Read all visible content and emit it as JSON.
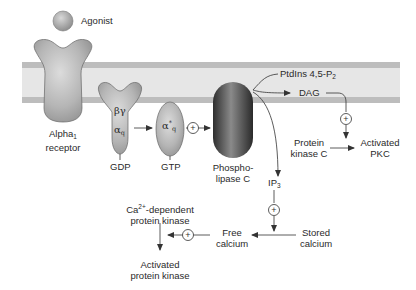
{
  "diagram": {
    "colors": {
      "membrane_band": "#bdbdbd",
      "membrane_core": "#e6e6e6",
      "protein_fill": "#b8b8b8",
      "plc_fill": "#555555",
      "line": "#333333",
      "text": "#2a2a2a"
    },
    "labels": {
      "agonist": "Agonist",
      "alpha1_receptor_line1": "Alpha",
      "alpha1_receptor_sub": "1",
      "alpha1_receptor_line2": "receptor",
      "beta_gamma": "βγ",
      "alpha_q": "α",
      "alpha_q_sub": "q",
      "alpha_star": "α",
      "alpha_star_sup": "*",
      "alpha_star_sub": "q",
      "gdp": "GDP",
      "gtp": "GTP",
      "plc_line1": "Phospho-",
      "plc_line2": "lipase C",
      "pip2_main": "PtdIns 4,5-P",
      "pip2_sub": "2",
      "dag": "DAG",
      "pkc_line1": "Protein",
      "pkc_line2": "kinase C",
      "activated_pkc_line1": "Activated",
      "activated_pkc_line2": "PKC",
      "ip3_main": "IP",
      "ip3_sub": "3",
      "stored_calcium_line1": "Stored",
      "stored_calcium_line2": "calcium",
      "free_calcium_line1": "Free",
      "free_calcium_line2": "calcium",
      "ca_kinase_prefix": "Ca",
      "ca_kinase_sup": "2+",
      "ca_kinase_line1_rest": "-dependent",
      "ca_kinase_line2": "protein kinase",
      "activated_kinase_line1": "Activated",
      "activated_kinase_line2": "protein kinase",
      "plus": "+"
    },
    "nodes": [
      "Agonist",
      "Alpha1 receptor",
      "Gq (βγ + αq) GDP",
      "α*q GTP",
      "Phospholipase C",
      "PtdIns 4,5-P2",
      "DAG",
      "Protein kinase C",
      "Activated PKC",
      "IP3",
      "Stored calcium",
      "Free calcium",
      "Ca2+-dependent protein kinase",
      "Activated protein kinase"
    ],
    "edges": [
      {
        "from": "Gq (βγ + αq) GDP",
        "to": "α*q GTP",
        "sign": ""
      },
      {
        "from": "α*q GTP",
        "to": "Phospholipase C",
        "sign": "+"
      },
      {
        "from": "PtdIns 4,5-P2",
        "to": "DAG",
        "sign": ""
      },
      {
        "from": "PtdIns 4,5-P2",
        "to": "IP3",
        "sign": ""
      },
      {
        "from": "DAG",
        "to": "Protein kinase C",
        "sign": "+"
      },
      {
        "from": "Protein kinase C",
        "to": "Activated PKC",
        "sign": ""
      },
      {
        "from": "IP3",
        "to": "Stored calcium",
        "sign": "+"
      },
      {
        "from": "Stored calcium",
        "to": "Free calcium",
        "sign": ""
      },
      {
        "from": "Free calcium",
        "to": "Ca2+-dependent protein kinase",
        "sign": "+"
      },
      {
        "from": "Ca2+-dependent protein kinase",
        "to": "Activated protein kinase",
        "sign": ""
      }
    ]
  }
}
